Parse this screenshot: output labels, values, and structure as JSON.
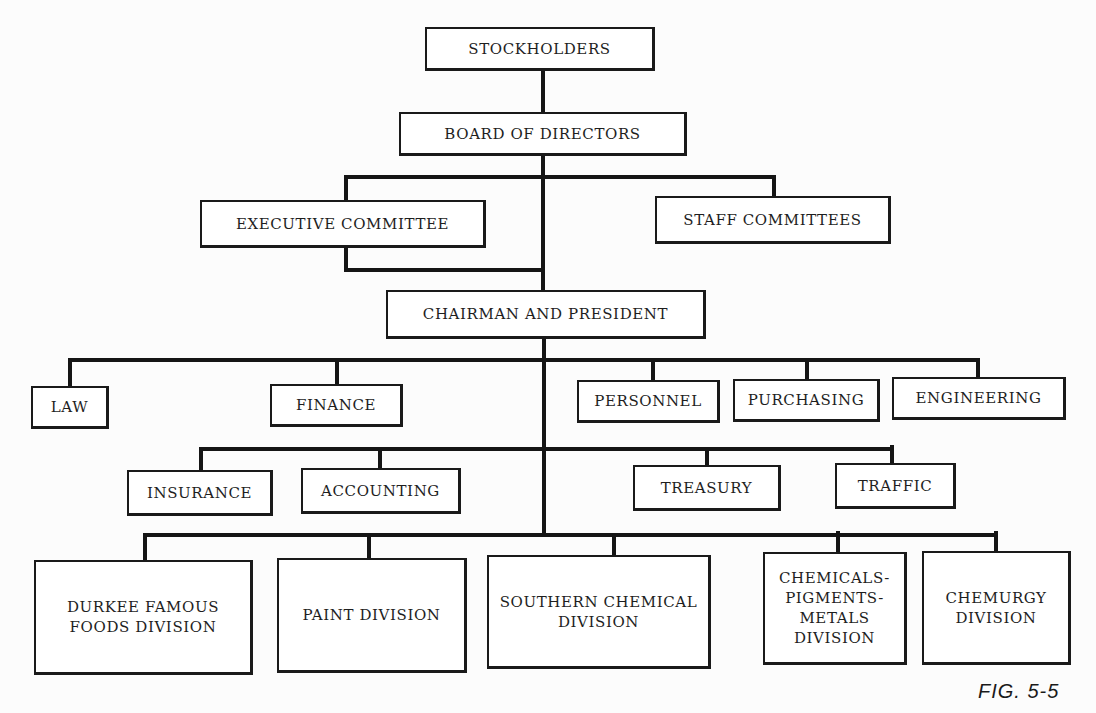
{
  "figure_label": "FIG. 5-5",
  "nodes": [
    {
      "id": "stockholders",
      "label": "STOCKHOLDERS",
      "x": 425,
      "y": 27,
      "w": 230,
      "h": 44
    },
    {
      "id": "board",
      "label": "BOARD OF DIRECTORS",
      "x": 399,
      "y": 112,
      "w": 288,
      "h": 44
    },
    {
      "id": "executive-committee",
      "label": "EXECUTIVE COMMITTEE",
      "x": 200,
      "y": 200,
      "w": 286,
      "h": 48
    },
    {
      "id": "staff-committees",
      "label": "STAFF COMMITTEES",
      "x": 655,
      "y": 196,
      "w": 236,
      "h": 48
    },
    {
      "id": "chairman-president",
      "label": "CHAIRMAN AND PRESIDENT",
      "x": 386,
      "y": 290,
      "w": 320,
      "h": 49
    },
    {
      "id": "law",
      "label": "LAW",
      "x": 31,
      "y": 386,
      "w": 78,
      "h": 43
    },
    {
      "id": "finance",
      "label": "FINANCE",
      "x": 270,
      "y": 384,
      "w": 133,
      "h": 43
    },
    {
      "id": "personnel",
      "label": "PERSONNEL",
      "x": 577,
      "y": 380,
      "w": 143,
      "h": 43
    },
    {
      "id": "purchasing",
      "label": "PURCHASING",
      "x": 733,
      "y": 379,
      "w": 147,
      "h": 43
    },
    {
      "id": "engineering",
      "label": "ENGINEERING",
      "x": 892,
      "y": 377,
      "w": 174,
      "h": 43
    },
    {
      "id": "insurance",
      "label": "INSURANCE",
      "x": 127,
      "y": 470,
      "w": 146,
      "h": 46
    },
    {
      "id": "accounting",
      "label": "ACCOUNTING",
      "x": 301,
      "y": 468,
      "w": 160,
      "h": 46
    },
    {
      "id": "treasury",
      "label": "TREASURY",
      "x": 633,
      "y": 465,
      "w": 148,
      "h": 46
    },
    {
      "id": "traffic",
      "label": "TRAFFIC",
      "x": 835,
      "y": 463,
      "w": 121,
      "h": 46
    },
    {
      "id": "durkee-division",
      "label": "DURKEE  FAMOUS\nFOODS DIVISION",
      "x": 34,
      "y": 560,
      "w": 219,
      "h": 115
    },
    {
      "id": "paint-division",
      "label": "PAINT DIVISION",
      "x": 277,
      "y": 558,
      "w": 190,
      "h": 115
    },
    {
      "id": "southern-chemical-division",
      "label": "SOUTHERN CHEMICAL\nDIVISION",
      "x": 487,
      "y": 555,
      "w": 224,
      "h": 114
    },
    {
      "id": "chemicals-pigments-metals-division",
      "label": "CHEMICALS-\nPIGMENTS-\nMETALS\nDIVISION",
      "x": 763,
      "y": 552,
      "w": 144,
      "h": 113
    },
    {
      "id": "chemurgy-division",
      "label": "CHEMURGY\nDIVISION",
      "x": 922,
      "y": 551,
      "w": 149,
      "h": 114
    }
  ],
  "lines": [
    {
      "x": 541,
      "y": 70,
      "w": 4,
      "h": 43
    },
    {
      "x": 541,
      "y": 155,
      "w": 4,
      "h": 136
    },
    {
      "x": 344,
      "y": 175,
      "w": 432,
      "h": 4
    },
    {
      "x": 344,
      "y": 175,
      "w": 4,
      "h": 26
    },
    {
      "x": 772,
      "y": 175,
      "w": 4,
      "h": 22
    },
    {
      "x": 344,
      "y": 247,
      "w": 4,
      "h": 24
    },
    {
      "x": 344,
      "y": 268,
      "w": 200,
      "h": 4
    },
    {
      "x": 542,
      "y": 338,
      "w": 4,
      "h": 198
    },
    {
      "x": 68,
      "y": 358,
      "w": 912,
      "h": 4
    },
    {
      "x": 68,
      "y": 358,
      "w": 4,
      "h": 29
    },
    {
      "x": 335,
      "y": 358,
      "w": 4,
      "h": 27
    },
    {
      "x": 651,
      "y": 358,
      "w": 4,
      "h": 23
    },
    {
      "x": 805,
      "y": 358,
      "w": 4,
      "h": 22
    },
    {
      "x": 976,
      "y": 358,
      "w": 4,
      "h": 20
    },
    {
      "x": 199,
      "y": 447,
      "w": 152,
      "h": 4
    },
    {
      "x": 199,
      "y": 447,
      "w": 4,
      "h": 24
    },
    {
      "x": 378,
      "y": 447,
      "w": 4,
      "h": 22
    },
    {
      "x": 344,
      "y": 447,
      "w": 550,
      "h": 4
    },
    {
      "x": 705,
      "y": 447,
      "w": 4,
      "h": 19
    },
    {
      "x": 890,
      "y": 445,
      "w": 4,
      "h": 19
    },
    {
      "x": 143,
      "y": 533,
      "w": 855,
      "h": 4
    },
    {
      "x": 143,
      "y": 533,
      "w": 4,
      "h": 28
    },
    {
      "x": 367,
      "y": 533,
      "w": 4,
      "h": 26
    },
    {
      "x": 612,
      "y": 533,
      "w": 4,
      "h": 23
    },
    {
      "x": 836,
      "y": 531,
      "w": 4,
      "h": 22
    },
    {
      "x": 994,
      "y": 531,
      "w": 4,
      "h": 21
    }
  ]
}
